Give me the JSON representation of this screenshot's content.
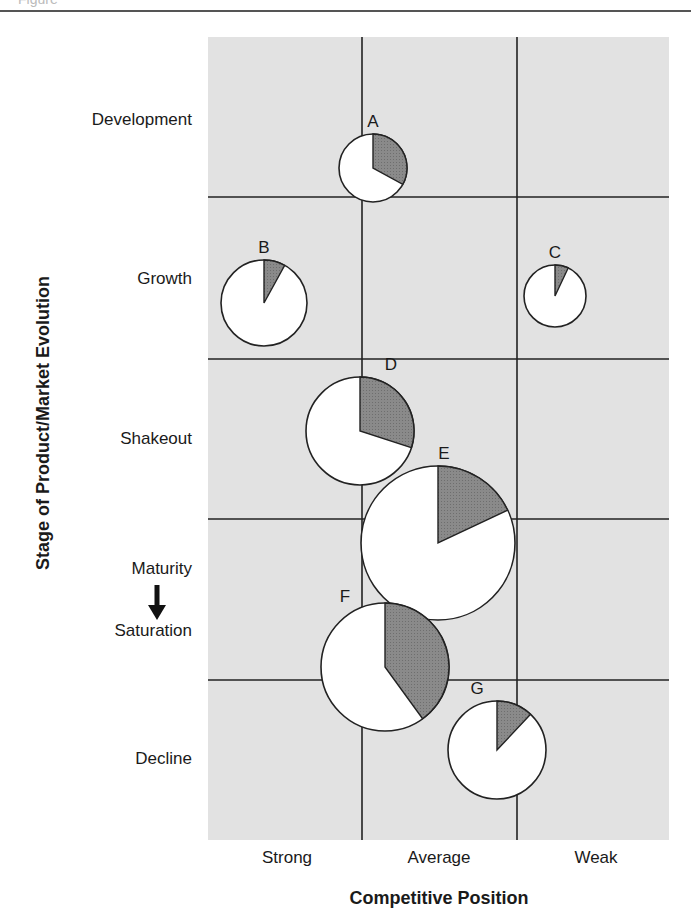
{
  "header": {
    "fragment": "Figure"
  },
  "chart_data": {
    "type": "pie-matrix",
    "title": "",
    "xlabel": "Competitive Position",
    "ylabel": "Stage of Product/Market Evolution",
    "x_categories": [
      "Strong",
      "Average",
      "Weak"
    ],
    "y_categories": [
      "Development",
      "Growth",
      "Shakeout",
      "Maturity ↓ Saturation",
      "Decline"
    ],
    "y_category_parts": {
      "maturity": "Maturity",
      "saturation": "Saturation"
    },
    "grid": true,
    "background_color": "#e2e2e2",
    "slice_color": "#8a8a8a",
    "pie_color": "#ffffff",
    "pies": [
      {
        "label": "A",
        "x_category": "Average",
        "y_category": "Development",
        "relative_size": 34,
        "share_pct": 33,
        "cx": 373,
        "cy": 168
      },
      {
        "label": "B",
        "x_category": "Strong",
        "y_category": "Growth",
        "relative_size": 43,
        "share_pct": 8,
        "cx": 264,
        "cy": 303
      },
      {
        "label": "C",
        "x_category": "Weak",
        "y_category": "Growth",
        "relative_size": 31,
        "share_pct": 7,
        "cx": 555,
        "cy": 296
      },
      {
        "label": "D",
        "x_category": "Strong/Average",
        "y_category": "Shakeout",
        "relative_size": 54,
        "share_pct": 30,
        "cx": 360,
        "cy": 431
      },
      {
        "label": "E",
        "x_category": "Average",
        "y_category": "Shakeout/Maturity",
        "relative_size": 77,
        "share_pct": 18,
        "cx": 438,
        "cy": 543
      },
      {
        "label": "F",
        "x_category": "Average",
        "y_category": "Maturity/Saturation",
        "relative_size": 64,
        "share_pct": 40,
        "cx": 385,
        "cy": 667
      },
      {
        "label": "G",
        "x_category": "Average/Weak",
        "y_category": "Decline",
        "relative_size": 49,
        "share_pct": 12,
        "cx": 497,
        "cy": 750
      }
    ]
  }
}
